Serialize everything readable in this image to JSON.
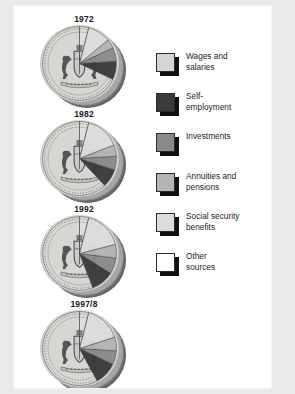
{
  "figure": {
    "background_color": "#ffffff",
    "page_background_color": "#e9eaea"
  },
  "legend": {
    "position": "right",
    "items": [
      {
        "label": "Wages and\nsalaries",
        "key": "wages",
        "color": "#d5d5d5",
        "swatch_name": "legend-swatch-wages"
      },
      {
        "label": "Self-\nemployment",
        "key": "self_employment",
        "color": "#3b3b3b",
        "swatch_name": "legend-swatch-self-employment"
      },
      {
        "label": "Investments",
        "key": "investments",
        "color": "#8a8a8a",
        "swatch_name": "legend-swatch-investments"
      },
      {
        "label": "Annuities and\npensions",
        "key": "annuities",
        "color": "#b4b4b4",
        "swatch_name": "legend-swatch-annuities"
      },
      {
        "label": "Social security\nbenefits",
        "key": "social_security",
        "color": "#dcdcdc",
        "swatch_name": "legend-swatch-social-security"
      },
      {
        "label": "Other\nsources",
        "key": "other",
        "color": "#ffffff",
        "swatch_name": "legend-swatch-other"
      }
    ]
  },
  "chart_data": {
    "type": "pie",
    "subtitle": "",
    "xlabel": "",
    "ylabel": "",
    "grid": false,
    "legend_position": "right",
    "units": "percent",
    "categories": [
      "Wages and salaries",
      "Self-employment",
      "Investments",
      "Annuities and pensions",
      "Social security benefits",
      "Other sources"
    ],
    "category_colors": [
      "#d5d5d5",
      "#3b3b3b",
      "#8a8a8a",
      "#b4b4b4",
      "#dcdcdc",
      "#ffffff"
    ],
    "charts": [
      {
        "label": "1972",
        "values": [
          68,
          8,
          6,
          4,
          10,
          4
        ],
        "wedge_order": [
          "Wages and salaries",
          "Self-employment",
          "Investments",
          "Annuities and pensions",
          "Social security benefits",
          "Other sources"
        ]
      },
      {
        "label": "1982",
        "values": [
          62,
          8,
          6,
          5,
          15,
          4
        ],
        "wedge_order": [
          "Wages and salaries",
          "Self-employment",
          "Investments",
          "Annuities and pensions",
          "Social security benefits",
          "Other sources"
        ]
      },
      {
        "label": "1992",
        "values": [
          56,
          10,
          7,
          6,
          17,
          4
        ],
        "wedge_order": [
          "Wages and salaries",
          "Self-employment",
          "Investments",
          "Annuities and pensions",
          "Social security benefits",
          "Other sources"
        ]
      },
      {
        "label": "1997/8",
        "values": [
          58,
          10,
          6,
          6,
          16,
          4
        ],
        "wedge_order": [
          "Wages and salaries",
          "Self-employment",
          "Investments",
          "Annuities and pensions",
          "Social security benefits",
          "Other sources"
        ]
      }
    ]
  },
  "coins": {
    "face_color": "#d9d9d7",
    "edge_color": "#8d8d8d",
    "motif": "royal-coat-of-arms"
  }
}
